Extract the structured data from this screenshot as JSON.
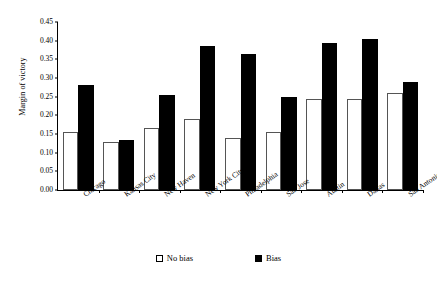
{
  "chart_data": {
    "type": "bar",
    "title": "",
    "xlabel": "",
    "ylabel": "Margin of victory",
    "ylim": [
      0.0,
      0.45
    ],
    "ytick_step": 0.05,
    "yticks": [
      "0.00",
      "0.05",
      "0.10",
      "0.15",
      "0.20",
      "0.25",
      "0.30",
      "0.35",
      "0.40",
      "0.45"
    ],
    "grid": false,
    "legend_position": "bottom-center",
    "categories": [
      "Chicago",
      "Kansas City",
      "New Haven",
      "New York City",
      "Philadelphia",
      "San Jose",
      "Austin",
      "Dallas",
      "San Antonio"
    ],
    "series": [
      {
        "name": "No bias",
        "color": "#ffffff",
        "values": [
          0.155,
          0.128,
          0.165,
          0.19,
          0.14,
          0.155,
          0.245,
          0.245,
          0.26
        ]
      },
      {
        "name": "Bias",
        "color": "#000000",
        "values": [
          0.28,
          0.135,
          0.255,
          0.385,
          0.365,
          0.25,
          0.395,
          0.405,
          0.29
        ]
      }
    ]
  },
  "legend": {
    "items": [
      {
        "label": "No bias",
        "swatch": "hollow-square-icon"
      },
      {
        "label": "Bias",
        "swatch": "filled-square-icon"
      }
    ]
  }
}
